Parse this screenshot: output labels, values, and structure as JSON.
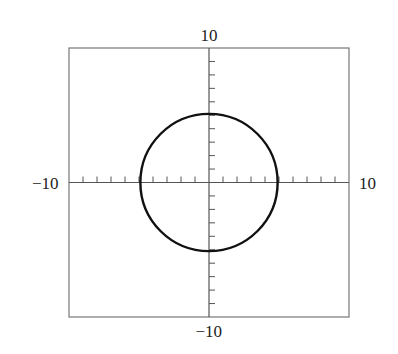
{
  "chart_data": {
    "type": "line",
    "title": "",
    "xlabel": "",
    "ylabel": "",
    "xlim": [
      -10,
      10
    ],
    "ylim": [
      -10,
      10
    ],
    "grid": false,
    "legend": null,
    "axis_labels": {
      "x_min": "−10",
      "x_max": "10",
      "y_min": "−10",
      "y_max": "10"
    },
    "tick_spacing": 1,
    "series": [
      {
        "name": "circle",
        "equation": "x^2 + y^2 = 25",
        "center": [
          0,
          0
        ],
        "radius": 5,
        "color": "#111111"
      }
    ]
  },
  "colors": {
    "frame": "#777777",
    "axes": "#555555",
    "curve": "#111111",
    "text": "#222222"
  }
}
